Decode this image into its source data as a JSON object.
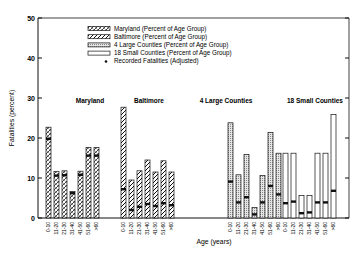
{
  "chart_data": {
    "type": "bar",
    "title": "",
    "xlabel": "Age (years)",
    "ylabel": "Fatalities (percent)",
    "ylim": [
      0,
      50
    ],
    "yticks": [
      0,
      10,
      20,
      30,
      40,
      50
    ],
    "grid": false,
    "legend_position": "upper center",
    "legend": [
      "Maryland (Percent of Age Group)",
      "Baltimore (Percent of Age Group)",
      "4 Large Counties (Percent of Age Group)",
      "18 Small Counties (Percent of Age Group)",
      "Recorded Fatalities (Adjusted)"
    ],
    "categories": [
      "0-10",
      "11-20",
      "21-30",
      "31-40",
      "41-50",
      "51-60",
      ">60"
    ],
    "panels": [
      {
        "name": "Maryland",
        "pattern": "maryland",
        "values": [
          22.7,
          11.6,
          11.8,
          6.6,
          11.7,
          17.6,
          17.6
        ],
        "recorded": [
          19.8,
          10.6,
          10.7,
          6.2,
          10.8,
          15.6,
          15.6
        ]
      },
      {
        "name": "Baltimore",
        "pattern": "baltimore",
        "values": [
          27.7,
          9.5,
          11.8,
          14.5,
          11.5,
          14.3,
          11.5
        ],
        "recorded": [
          7.2,
          2.0,
          2.8,
          3.5,
          3.0,
          3.7,
          3.2
        ]
      },
      {
        "name": "4 Large Counties",
        "pattern": "large",
        "values": [
          23.8,
          10.8,
          15.9,
          2.6,
          10.6,
          21.4,
          16.2
        ],
        "recorded": [
          9.1,
          3.9,
          5.2,
          0.9,
          3.9,
          8.0,
          5.9
        ]
      },
      {
        "name": "18 Small Counties",
        "pattern": "small",
        "values": [
          16.2,
          16.2,
          5.6,
          5.6,
          16.2,
          16.2,
          25.9
        ],
        "recorded": [
          3.7,
          4.1,
          1.2,
          1.4,
          3.9,
          3.9,
          6.8
        ]
      }
    ]
  },
  "labels": {
    "xlabel": "Age (years)",
    "ylabel": "Fatalities (percent)"
  }
}
